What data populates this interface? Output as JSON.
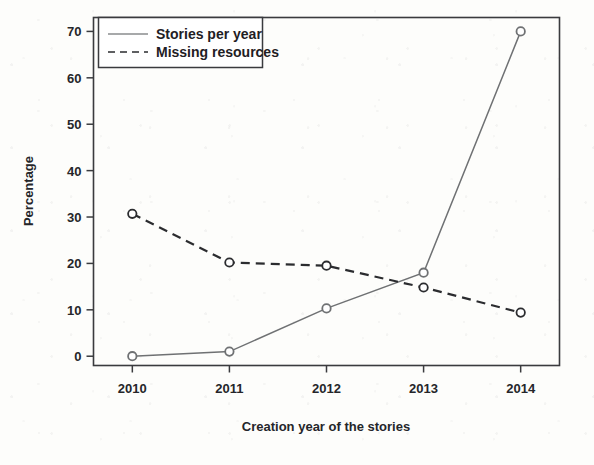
{
  "chart_data": {
    "type": "line",
    "title": "",
    "xlabel": "Creation year of the stories",
    "ylabel": "Percentage",
    "categories": [
      "2010",
      "2011",
      "2012",
      "2013",
      "2014"
    ],
    "x": [
      2010,
      2011,
      2012,
      2013,
      2014
    ],
    "xlim": [
      2009.6,
      2014.4
    ],
    "ylim": [
      -2,
      73
    ],
    "yticks": [
      "0",
      "10",
      "20",
      "30",
      "40",
      "50",
      "60",
      "70"
    ],
    "ytick_values": [
      0,
      10,
      20,
      30,
      40,
      50,
      60,
      70
    ],
    "grid": false,
    "legend_position": "top-left",
    "series": [
      {
        "name": "Stories per year",
        "style": "solid",
        "color": "#6f7173",
        "marker": "open-circle",
        "values": [
          0,
          1,
          10.3,
          18,
          70
        ]
      },
      {
        "name": "Missing resources",
        "style": "dashed",
        "color": "#2b2c2f",
        "marker": "open-circle",
        "values": [
          30.7,
          20.2,
          19.5,
          14.8,
          9.4
        ]
      }
    ]
  },
  "legend": {
    "items": [
      {
        "label": "Stories per year"
      },
      {
        "label": "Missing resources"
      }
    ]
  },
  "axes": {
    "x_label": "Creation year of the stories",
    "y_label": "Percentage",
    "x_ticks": [
      "2010",
      "2011",
      "2012",
      "2013",
      "2014"
    ],
    "y_ticks": [
      "0",
      "10",
      "20",
      "30",
      "40",
      "50",
      "60",
      "70"
    ]
  }
}
